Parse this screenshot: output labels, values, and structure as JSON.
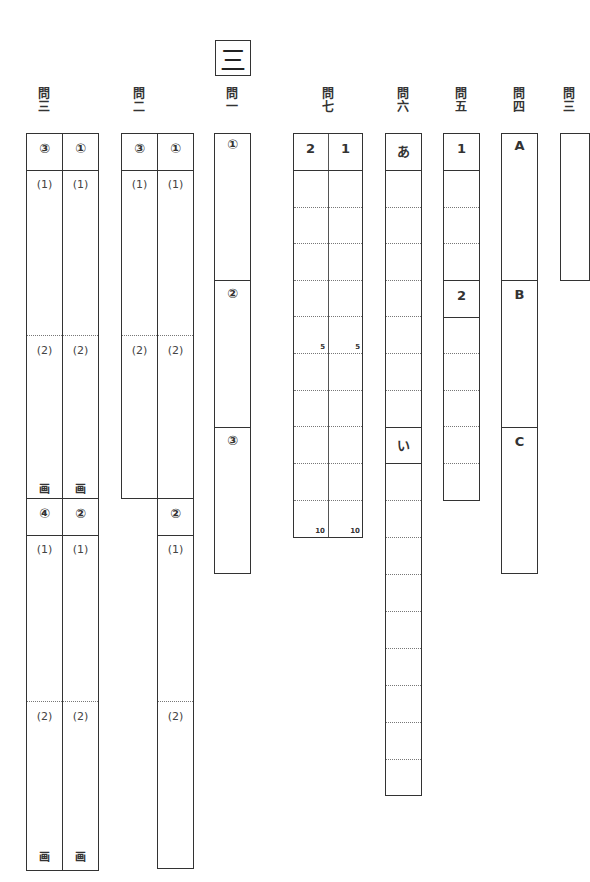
{
  "section": {
    "label": "三"
  },
  "questions": {
    "q3": {
      "label_top": "問",
      "label_bottom": "三",
      "columns": [
        {
          "header_top": "③",
          "header_bottom": "④",
          "top_parts": [
            "(1)",
            "(2)"
          ],
          "bottom_parts": [
            "(1)",
            "(2)"
          ],
          "drawing_mark": "画"
        },
        {
          "header_top": "①",
          "header_bottom": "②",
          "top_parts": [
            "(1)",
            "(2)"
          ],
          "bottom_parts": [
            "(1)",
            "(2)"
          ],
          "drawing_mark": "画"
        }
      ]
    },
    "q2": {
      "label_top": "問",
      "label_bottom": "二",
      "columns": [
        {
          "header_top": "③",
          "top_parts": [
            "(1)",
            "(2)"
          ]
        },
        {
          "header_top": "①",
          "header_bottom": "②",
          "top_parts": [
            "(1)",
            "(2)"
          ],
          "bottom_parts": [
            "(1)",
            "(2)"
          ]
        }
      ]
    },
    "q1": {
      "label_top": "問",
      "label_bottom": "一",
      "parts": [
        "①",
        "②",
        "③"
      ]
    },
    "q7": {
      "label_top": "問",
      "label_bottom": "七",
      "columns": [
        "2",
        "1"
      ],
      "row_markers": {
        "5": "5",
        "10": "10"
      },
      "rows": 10
    },
    "q6": {
      "label_top": "問",
      "label_bottom": "六",
      "parts": [
        "あ",
        "い"
      ]
    },
    "q5": {
      "label_top": "問",
      "label_bottom": "五",
      "parts": [
        "1",
        "2"
      ]
    },
    "q4": {
      "label_top": "問",
      "label_bottom": "四",
      "parts": [
        "A",
        "B",
        "C"
      ]
    },
    "q3b": {
      "label_top": "問",
      "label_bottom": "三"
    }
  }
}
